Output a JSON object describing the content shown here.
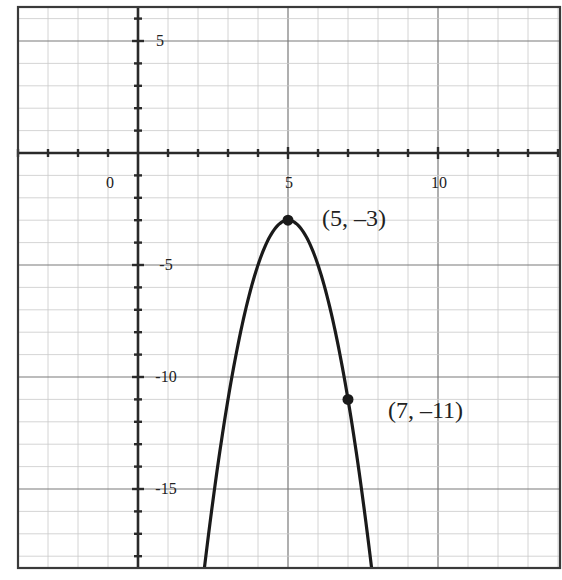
{
  "chart_data": {
    "type": "line",
    "title": "",
    "xlabel": "",
    "ylabel": "",
    "function": "y = -2(x - 5)^2 - 3",
    "xlim": [
      -4,
      14.07
    ],
    "ylim": [
      -18.5,
      6.5
    ],
    "grid": true,
    "grid_minor_step": 1,
    "grid_major_step": 5,
    "x_tick_labels": [
      {
        "value": 0,
        "label": "0"
      },
      {
        "value": 5,
        "label": "5"
      },
      {
        "value": 10,
        "label": "10"
      }
    ],
    "y_tick_labels": [
      {
        "value": 5,
        "label": "5"
      },
      {
        "value": -5,
        "label": "-5"
      },
      {
        "value": -10,
        "label": "-10"
      },
      {
        "value": -15,
        "label": "-15"
      }
    ],
    "series": [
      {
        "name": "parabola",
        "x": [
          2.22,
          2.5,
          3,
          3.5,
          4,
          4.5,
          5,
          5.5,
          6,
          6.5,
          7,
          7.5,
          7.78
        ],
        "values": [
          -18.46,
          -15.5,
          -11,
          -7.5,
          -5,
          -3.5,
          -3,
          -3.5,
          -5,
          -7.5,
          -11,
          -15.5,
          -18.46
        ]
      }
    ],
    "points": [
      {
        "x": 5,
        "y": -3,
        "label": "(5, –3)"
      },
      {
        "x": 7,
        "y": -11,
        "label": "(7, –11)"
      }
    ],
    "legend": null
  },
  "layout": {
    "frame": {
      "left": 18,
      "top": 7,
      "right": 560,
      "bottom": 568
    },
    "origin_px": {
      "x": 138,
      "y": 153
    },
    "unit_px": {
      "x": 30,
      "y": 22.4
    }
  },
  "labels": {
    "x0": "0",
    "x5": "5",
    "x10": "10",
    "y5": "5",
    "yneg5": "-5",
    "yneg10": "-10",
    "yneg15": "-15",
    "vertex": "(5, –3)",
    "point2": "(7, –11)"
  },
  "colors": {
    "curve": "#1a1a1a",
    "axis": "#2a2a2a",
    "grid_minor": "#c9c9c9",
    "grid_major": "#7a7a7a"
  }
}
